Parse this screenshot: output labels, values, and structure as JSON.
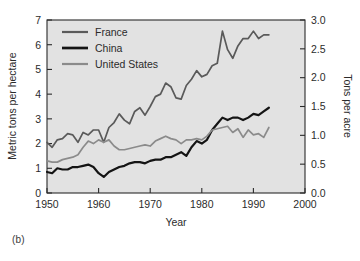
{
  "figure": {
    "caption": "(b)"
  },
  "chart_data": {
    "type": "line",
    "title": "",
    "xlabel": "Year",
    "ylabel": "Metric tons per hectare",
    "y2label": "Tons per acre",
    "xlim": [
      1950,
      2000
    ],
    "ylim": [
      0,
      7
    ],
    "y2lim": [
      0.0,
      3.0
    ],
    "grid": false,
    "legend_position": "top-left",
    "xticks": [
      1950,
      1960,
      1970,
      1980,
      1990,
      2000
    ],
    "xticklabels": [
      "1950",
      "1960",
      "1970",
      "1980",
      "1990",
      "2000"
    ],
    "yticks": [
      0,
      1,
      2,
      3,
      4,
      5,
      6,
      7
    ],
    "yticklabels": [
      "0",
      "1",
      "2",
      "3",
      "4",
      "5",
      "6",
      "7"
    ],
    "y2ticks": [
      0.0,
      0.5,
      1.0,
      1.5,
      2.0,
      2.5,
      3.0
    ],
    "y2ticklabels": [
      "0.0",
      "0.5",
      "1.0",
      "1.5",
      "2.0",
      "2.5",
      "3.0"
    ],
    "plot_bg": "#e2e2e2",
    "x": [
      1950,
      1951,
      1952,
      1953,
      1954,
      1955,
      1956,
      1957,
      1958,
      1959,
      1960,
      1961,
      1962,
      1963,
      1964,
      1965,
      1966,
      1967,
      1968,
      1969,
      1970,
      1971,
      1972,
      1973,
      1974,
      1975,
      1976,
      1977,
      1978,
      1979,
      1980,
      1981,
      1982,
      1983,
      1984,
      1985,
      1986,
      1987,
      1988,
      1989,
      1990,
      1991,
      1992,
      1993
    ],
    "series": [
      {
        "name": "France",
        "color": "#5a5a5a",
        "width": 1.7,
        "values": [
          2.05,
          1.85,
          2.15,
          2.2,
          2.4,
          2.35,
          2.05,
          2.45,
          2.35,
          2.55,
          2.55,
          2.05,
          2.65,
          2.85,
          3.2,
          2.95,
          2.8,
          3.3,
          3.45,
          3.15,
          3.5,
          3.9,
          4.0,
          4.45,
          4.3,
          3.85,
          3.8,
          4.35,
          4.6,
          4.95,
          4.7,
          4.8,
          5.15,
          5.25,
          6.55,
          5.8,
          5.45,
          5.95,
          6.25,
          6.25,
          6.55,
          6.25,
          6.4,
          6.4
        ]
      },
      {
        "name": "China",
        "color": "#141414",
        "width": 2.2,
        "values": [
          0.85,
          0.8,
          1.0,
          0.95,
          0.95,
          1.05,
          1.05,
          1.1,
          1.15,
          1.05,
          0.8,
          0.65,
          0.85,
          0.95,
          1.05,
          1.1,
          1.2,
          1.25,
          1.25,
          1.2,
          1.3,
          1.35,
          1.35,
          1.45,
          1.45,
          1.55,
          1.65,
          1.5,
          1.85,
          2.1,
          2.0,
          2.15,
          2.55,
          2.8,
          3.05,
          2.95,
          3.05,
          3.05,
          2.95,
          3.05,
          3.2,
          3.15,
          3.3,
          3.45
        ]
      },
      {
        "name": "United States",
        "color": "#8b8b8b",
        "width": 1.7,
        "values": [
          1.3,
          1.25,
          1.25,
          1.35,
          1.4,
          1.45,
          1.55,
          1.85,
          2.1,
          2.0,
          2.15,
          2.05,
          2.15,
          1.9,
          1.75,
          1.75,
          1.8,
          1.85,
          1.9,
          1.95,
          1.9,
          2.1,
          2.2,
          2.3,
          2.2,
          2.15,
          2.0,
          2.15,
          2.15,
          2.2,
          2.15,
          2.3,
          2.55,
          2.6,
          2.65,
          2.7,
          2.45,
          2.6,
          2.25,
          2.55,
          2.35,
          2.4,
          2.25,
          2.65
        ]
      }
    ]
  },
  "legend": {
    "entries": [
      "France",
      "China",
      "United States"
    ]
  }
}
